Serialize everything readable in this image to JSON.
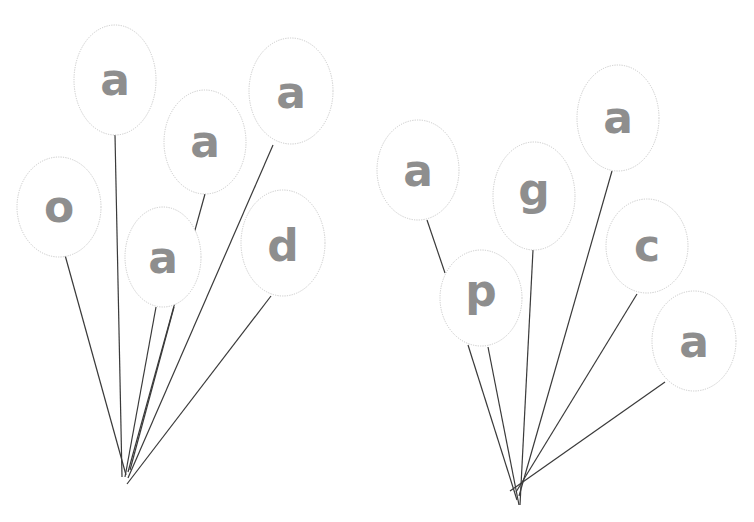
{
  "worksheet": {
    "bunches": [
      {
        "name": "left-bunch",
        "balloons": [
          {
            "letter": "a"
          },
          {
            "letter": "a"
          },
          {
            "letter": "a"
          },
          {
            "letter": "o"
          },
          {
            "letter": "a"
          },
          {
            "letter": "d"
          }
        ]
      },
      {
        "name": "right-bunch",
        "balloons": [
          {
            "letter": "a"
          },
          {
            "letter": "g"
          },
          {
            "letter": "a"
          },
          {
            "letter": "c"
          },
          {
            "letter": "p"
          },
          {
            "letter": "a"
          }
        ]
      }
    ],
    "colors": {
      "letter": "#8e8e8e",
      "outline": "#c9c9c9",
      "string": "#3a3a3a"
    }
  }
}
